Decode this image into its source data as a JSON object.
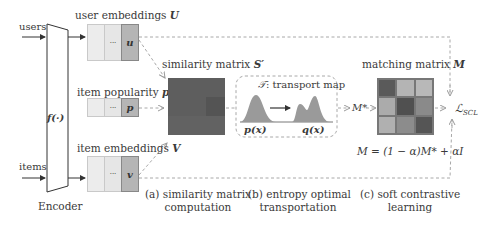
{
  "inputs": {
    "users_label": "users",
    "items_label": "items"
  },
  "encoder": {
    "function_label": "f(·)",
    "caption": "Encoder"
  },
  "embeddings": {
    "user": {
      "label": "user embeddings ",
      "symbol": "U",
      "cells": [
        "",
        "···",
        "u"
      ]
    },
    "popularity": {
      "label": "item popularity ",
      "symbol": "p",
      "cells": [
        "",
        "···",
        "p"
      ]
    },
    "item": {
      "label": "item embeddings ",
      "symbol": "V",
      "cells": [
        "",
        "···",
        "v"
      ]
    }
  },
  "similarity": {
    "label": "similarity matrix ",
    "symbol": "S′",
    "color": "#5e5e5e"
  },
  "transport": {
    "title_symbol": "𝒯",
    "title_text": ": transport map",
    "source_label": "p(x)",
    "target_label": "q(x)",
    "fill_color": "#9a9a9a"
  },
  "matching": {
    "label": "matching matrix ",
    "symbol": "M",
    "grid": [
      [
        "#5a5a5a",
        "#b4b4b4",
        "#b8b8b8"
      ],
      [
        "#ababab",
        "#505050",
        "#8a8a8a"
      ],
      [
        "#b0b0b0",
        "#8c8c8c",
        "#555555"
      ]
    ],
    "formula": "M = (1 − α)M* + αI"
  },
  "flow": {
    "m_star_label": "M*",
    "loss_label": "ℒ",
    "loss_subscript": "SCL"
  },
  "captions": {
    "a_line1": "(a) similarity matrix",
    "a_line2": "computation",
    "b_line1": "(b) entropy optimal",
    "b_line2": "transportation",
    "c_line1": "(c) soft  contrastive",
    "c_line2": "learning"
  }
}
